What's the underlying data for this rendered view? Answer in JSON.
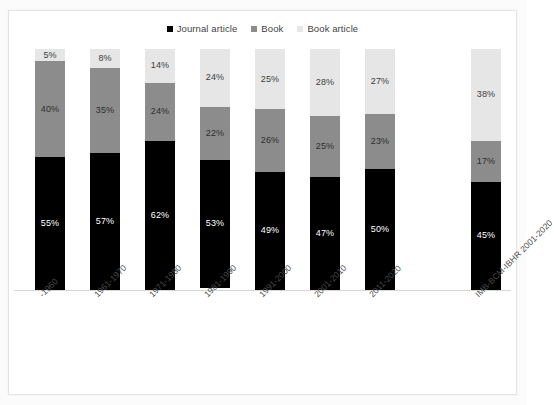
{
  "chart_data": {
    "type": "bar",
    "subtype": "100% stacked column",
    "title": "",
    "xlabel": "",
    "ylabel": "",
    "ylim": [
      0,
      100
    ],
    "grid": false,
    "legend_position": "top-center",
    "categories": [
      "-1960",
      "1961-1970",
      "1971-1980",
      "1981-1990",
      "1991-2000",
      "2001-2010",
      "2011-2020",
      "IMB-BCM-IBHR 2001-2020"
    ],
    "series": [
      {
        "name": "Journal article",
        "color": "#000000",
        "values": [
          55,
          57,
          62,
          53,
          49,
          47,
          50,
          45
        ],
        "labels": [
          "55%",
          "57%",
          "62%",
          "53%",
          "49%",
          "47%",
          "50%",
          "45%"
        ]
      },
      {
        "name": "Book",
        "color": "#8c8c8c",
        "values": [
          40,
          35,
          24,
          22,
          26,
          25,
          23,
          17
        ],
        "labels": [
          "40%",
          "35%",
          "24%",
          "22%",
          "26%",
          "25%",
          "23%",
          "17%"
        ]
      },
      {
        "name": "Book article",
        "color": "#e6e6e6",
        "values": [
          5,
          8,
          14,
          24,
          25,
          28,
          27,
          38
        ],
        "labels": [
          "5%",
          "8%",
          "14%",
          "24%",
          "25%",
          "28%",
          "27%",
          "38%"
        ]
      }
    ]
  },
  "legend": {
    "items": [
      {
        "label": "Journal article",
        "color": "#000000"
      },
      {
        "label": "Book",
        "color": "#8c8c8c"
      },
      {
        "label": "Book article",
        "color": "#e6e6e6"
      }
    ]
  },
  "layout": {
    "bar_positions": [
      21,
      76,
      131,
      186,
      241,
      296,
      351,
      457
    ],
    "bar_width": 30,
    "label_offsets": [
      21,
      76,
      131,
      186,
      241,
      296,
      351,
      457
    ]
  }
}
